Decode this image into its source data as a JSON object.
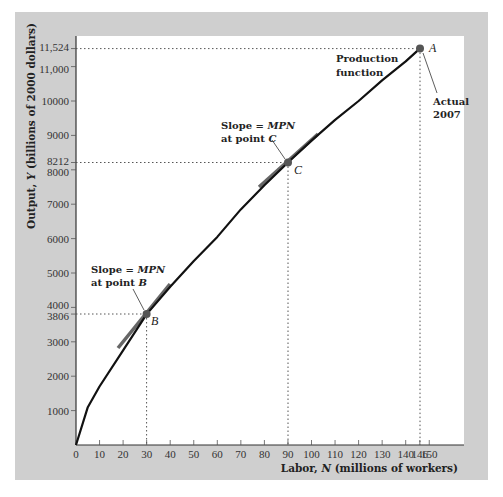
{
  "chart_data": {
    "type": "line",
    "title": "",
    "xlabel": "Labor, N (millions of workers)",
    "ylabel": "Output, Y (billions of 2000 dollars)",
    "xlim": [
      0,
      160
    ],
    "ylim": [
      0,
      12000
    ],
    "grid": false,
    "x_ticks": [
      0,
      10,
      20,
      30,
      40,
      50,
      60,
      70,
      80,
      90,
      100,
      110,
      120,
      130,
      140,
      146,
      150
    ],
    "y_ticks": [
      1000,
      2000,
      3000,
      3806,
      4000,
      5000,
      6000,
      7000,
      8000,
      8212,
      9000,
      10000,
      11000,
      11524
    ],
    "y_tick_labels": [
      "1000",
      "2000",
      "3000",
      "3806",
      "4000",
      "5000",
      "6000",
      "7000",
      "8000",
      "8212",
      "9000",
      "10000",
      "11,000",
      "11,524"
    ],
    "series": [
      {
        "name": "Production function",
        "x": [
          0,
          5,
          10,
          20,
          30,
          40,
          50,
          60,
          70,
          80,
          90,
          100,
          110,
          120,
          130,
          140,
          146
        ],
        "values": [
          0,
          1100,
          1700,
          2750,
          3806,
          4600,
          5350,
          6050,
          6850,
          7550,
          8212,
          8850,
          9450,
          10000,
          10600,
          11150,
          11524
        ]
      }
    ],
    "points": [
      {
        "label": "A",
        "x": 146,
        "y": 11524,
        "note": "Actual 2007"
      },
      {
        "label": "B",
        "x": 30,
        "y": 3806,
        "note": "Slope = MPN at point B"
      },
      {
        "label": "C",
        "x": 90,
        "y": 8212,
        "note": "Slope = MPN at point C"
      }
    ],
    "annotations": [
      {
        "text_line1": "Production",
        "text_line2": "function"
      },
      {
        "text_line1": "Actual",
        "text_line2": "2007"
      },
      {
        "text_line1_prefix": "Slope = ",
        "text_line1_em": "MPN",
        "text_line2_prefix": "at point ",
        "text_line2_em": "B"
      },
      {
        "text_line1_prefix": "Slope = ",
        "text_line1_em": "MPN",
        "text_line2_prefix": "at point ",
        "text_line2_em": "C"
      }
    ]
  },
  "labels": {
    "xlabel_prefix": "Labor, ",
    "xlabel_var": "N",
    "xlabel_suffix": " (millions of workers)",
    "ylabel_prefix": "Output, ",
    "ylabel_var": "Y",
    "ylabel_suffix": " (billions of 2000 dollars)",
    "prod_line1": "Production",
    "prod_line2": "function",
    "actual_line1": "Actual",
    "actual_line2": "2007",
    "slope_prefix": "Slope = ",
    "slope_var": "MPN",
    "atpoint_prefix": "at point ",
    "point_a": "A",
    "point_b": "B",
    "point_c": "C"
  },
  "colors": {
    "panel": "#cfcfcf",
    "plot": "#ffffff",
    "curve": "#111111",
    "tangent": "#555555",
    "point": "#555555"
  }
}
